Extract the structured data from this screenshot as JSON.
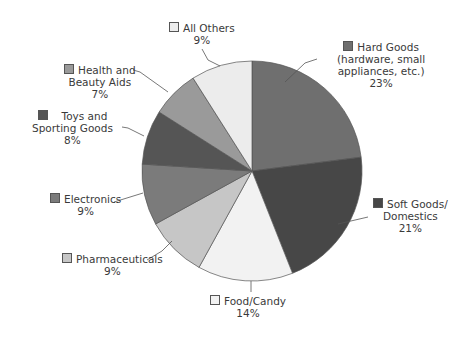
{
  "chart_data": {
    "type": "pie",
    "title": "",
    "start_angle_deg": 0,
    "direction": "clockwise",
    "slices": [
      {
        "label": "Hard Goods (hardware, small appliances, etc.)",
        "value": 23,
        "color": "#6f6f6f"
      },
      {
        "label": "Soft Goods/Domestics",
        "value": 21,
        "color": "#474747"
      },
      {
        "label": "Food/Candy",
        "value": 14,
        "color": "#f2f2f2"
      },
      {
        "label": "Pharmaceuticals",
        "value": 9,
        "color": "#c6c6c6"
      },
      {
        "label": "Electronics",
        "value": 9,
        "color": "#7b7b7b"
      },
      {
        "label": "Toys and Sporting Goods",
        "value": 8,
        "color": "#555555"
      },
      {
        "label": "Health and Beauty Aids",
        "value": 7,
        "color": "#9a9a9a"
      },
      {
        "label": "All Others",
        "value": 9,
        "color": "#ececec"
      }
    ],
    "units": "%"
  },
  "labels": {
    "hard_goods": {
      "line1": "Hard Goods",
      "line2": "(hardware, small",
      "line3": "appliances, etc.)",
      "pct": "23%"
    },
    "soft_goods": {
      "line1": "Soft Goods/",
      "line2": "Domestics",
      "pct": "21%"
    },
    "food": {
      "line1": "Food/Candy",
      "pct": "14%"
    },
    "pharma": {
      "line1": "Pharmaceuticals",
      "pct": "9%"
    },
    "electronics": {
      "line1": "Electronics",
      "pct": "9%"
    },
    "toys": {
      "line1": "Toys and",
      "line2": "Sporting Goods",
      "pct": "8%"
    },
    "health": {
      "line1": "Health and",
      "line2": "Beauty Aids",
      "pct": "7%"
    },
    "others": {
      "line1": "All Others",
      "pct": "9%"
    }
  }
}
